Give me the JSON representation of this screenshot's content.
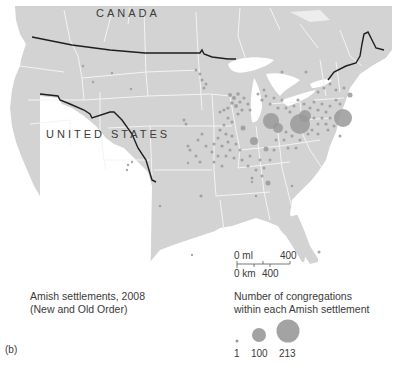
{
  "map": {
    "labels": {
      "canada": "CANADA",
      "united_states": "UNITED STATES"
    },
    "colors": {
      "land": "#d3d3d3",
      "state_borders": "#f2f2f2",
      "water": "#ffffff",
      "international_border": "#1e1e1e",
      "settlement_dot": "#999999"
    },
    "scale_bar": {
      "miles_start": "0 ml",
      "miles_end": "400",
      "km_start": "0 km",
      "km_end": "400"
    }
  },
  "caption": {
    "line1": "Amish settlements, 2008",
    "line2": "(New and Old Order)"
  },
  "legend": {
    "title_line1": "Number of congregations",
    "title_line2": "within each Amish settlement",
    "sizes": [
      {
        "value": "1",
        "radius": 1.5
      },
      {
        "value": "100",
        "radius": 7
      },
      {
        "value": "213",
        "radius": 11.5
      }
    ]
  },
  "panel_label": "(b)"
}
